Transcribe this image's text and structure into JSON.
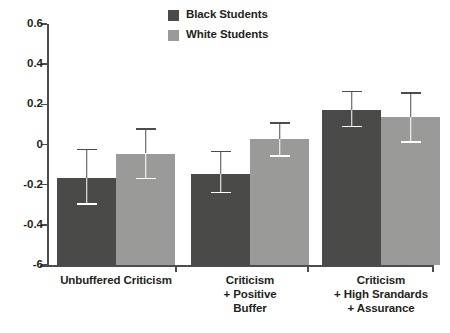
{
  "chart_data": {
    "type": "bar",
    "title": "",
    "subtitle": "",
    "xlabel": "",
    "ylabel": "",
    "ylim": [
      -0.6,
      0.6
    ],
    "grid": false,
    "legend_position": "top-center",
    "categories": [
      "Unbuffered Criticism",
      "Criticism\n+ Positive\nBuffer",
      "Criticism\n+ High Srandards\n+ Assurance"
    ],
    "ytick_labels": [
      "0.6",
      "0.4",
      "0.2",
      "0",
      "-0.2",
      "-0.4",
      "-6"
    ],
    "ytick_values": [
      0.6,
      0.4,
      0.2,
      0,
      -0.2,
      -0.4,
      -0.6
    ],
    "series": [
      {
        "name": "Black Students",
        "color": "#4a4a48",
        "values": [
          -0.166,
          -0.148,
          0.17
        ],
        "error_low": [
          -0.3,
          -0.243,
          0.085
        ],
        "error_high": [
          -0.021,
          -0.031,
          0.268
        ]
      },
      {
        "name": "White Students",
        "color": "#9a9a98",
        "values": [
          -0.045,
          0.027,
          0.135
        ],
        "error_low": [
          -0.173,
          -0.061,
          0.009
        ],
        "error_high": [
          0.081,
          0.111,
          0.259
        ]
      }
    ]
  },
  "legend": {
    "items": [
      {
        "label": "Black Students",
        "color": "#4a4a48"
      },
      {
        "label": "White Students",
        "color": "#9a9a98"
      }
    ]
  },
  "axis": {
    "line_color": "#4c4c4c"
  }
}
